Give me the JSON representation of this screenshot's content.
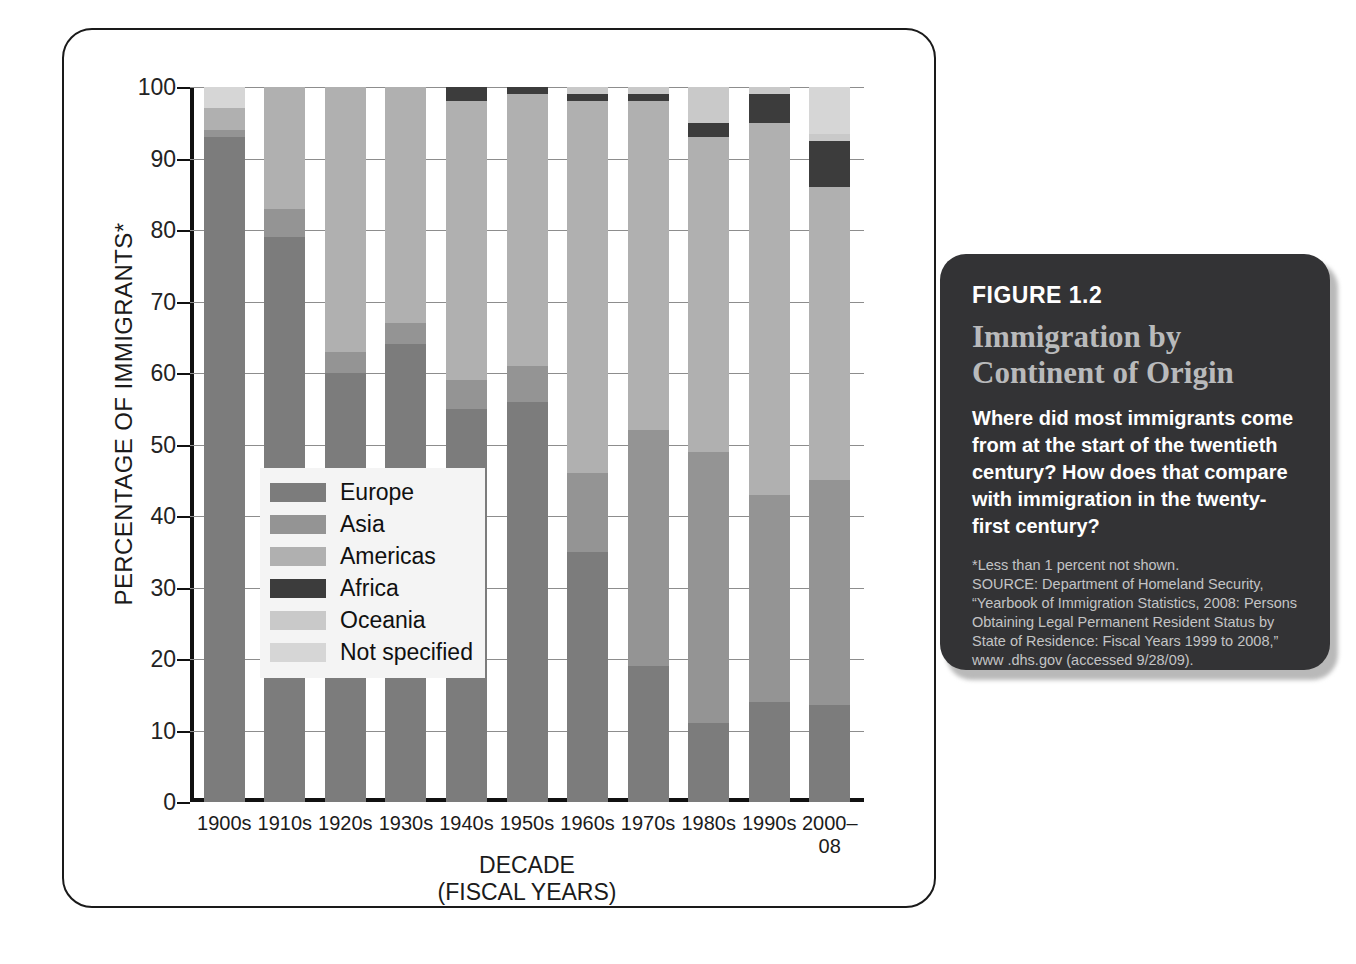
{
  "chart_data": {
    "type": "bar",
    "subtype": "stacked-percentage",
    "title": "Immigration by Continent of Origin",
    "xlabel": "DECADE (FISCAL YEARS)",
    "ylabel": "PERCENTAGE OF IMMIGRANTS*",
    "ylim": [
      0,
      100
    ],
    "yticks": [
      0,
      10,
      20,
      30,
      40,
      50,
      60,
      70,
      80,
      90,
      100
    ],
    "grid": true,
    "legend_position": "inside-left",
    "categories": [
      "1900s",
      "1910s",
      "1920s",
      "1930s",
      "1940s",
      "1950s",
      "1960s",
      "1970s",
      "1980s",
      "1990s",
      "2000–08"
    ],
    "series": [
      {
        "name": "Europe",
        "color": "#7c7c7c",
        "values": [
          93,
          79,
          60,
          64,
          55,
          56,
          35,
          19,
          11,
          14,
          13.5
        ]
      },
      {
        "name": "Asia",
        "color": "#949494",
        "values": [
          1,
          4,
          3,
          3,
          4,
          5,
          11,
          33,
          38,
          29,
          31.5
        ]
      },
      {
        "name": "Americas",
        "color": "#b0b0b0",
        "values": [
          3,
          17,
          37,
          33,
          39,
          38,
          52,
          46,
          44,
          52,
          41
        ]
      },
      {
        "name": "Africa",
        "color": "#3c3c3c",
        "values": [
          0,
          0,
          0,
          0,
          2,
          1,
          1,
          1,
          2,
          4,
          6.5
        ]
      },
      {
        "name": "Oceania",
        "color": "#c9c9c9",
        "values": [
          0,
          0,
          0,
          0,
          0,
          0,
          1,
          1,
          5,
          1,
          1
        ]
      },
      {
        "name": "Not specified",
        "color": "#d6d6d6",
        "values": [
          3,
          0,
          0,
          0,
          0,
          0,
          0,
          0,
          0,
          0,
          6.5
        ]
      }
    ],
    "x_tick_labels": [
      "1900s",
      "1910s",
      "1920s",
      "1930s",
      "1940s",
      "1950s",
      "1960s",
      "1970s",
      "1980s",
      "1990s",
      "2000–08"
    ],
    "y_tick_labels": [
      "100",
      "90",
      "80",
      "70",
      "60",
      "50",
      "40",
      "30",
      "20",
      "10",
      "0"
    ],
    "xlabel_line1": "DECADE",
    "xlabel_line2": "(FISCAL YEARS)"
  },
  "axes": {
    "y_title": "PERCENTAGE OF IMMIGRANTS*",
    "x_title_line1": "DECADE",
    "x_title_line2": "(FISCAL YEARS)"
  },
  "legend": {
    "items": [
      {
        "label": "Europe",
        "color": "#7c7c7c"
      },
      {
        "label": "Asia",
        "color": "#949494"
      },
      {
        "label": "Americas",
        "color": "#b0b0b0"
      },
      {
        "label": "Africa",
        "color": "#3c3c3c"
      },
      {
        "label": "Oceania",
        "color": "#c9c9c9"
      },
      {
        "label": "Not specified",
        "color": "#d6d6d6"
      }
    ]
  },
  "panel": {
    "figure_label": "FIGURE 1.2",
    "title": "Immigration by Continent of Origin",
    "question": "Where did most immigrants come from at the start of the twentieth century? How does that compare with immigration in the twenty-first century?",
    "footnote": "*Less than 1 percent not shown.",
    "source": "SOURCE: Department of Homeland Security, “Yearbook of Immigration Statistics, 2008: Persons Obtaining Legal Permanent Resident Status by State of Residence: Fiscal Years 1999 to 2008,” www .dhs.gov (accessed 9/28/09).",
    "background_color": "#333335",
    "title_color": "#b9babb"
  }
}
